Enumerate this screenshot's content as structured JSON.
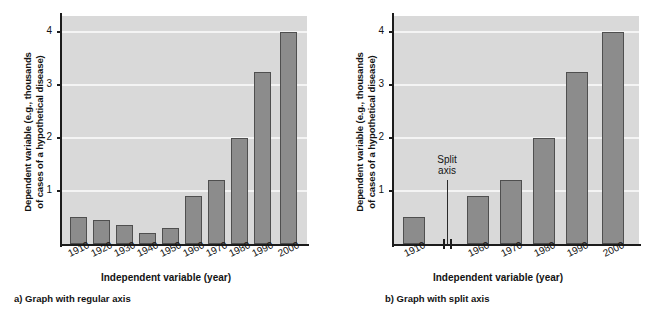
{
  "figure": {
    "axis_label_y": "Dependent variable (e.g., thousands",
    "axis_label_y_line2": "of cases of a hypothetical disease)",
    "axis_label_x": "Independent variable (year)"
  },
  "panel_a": {
    "caption": "a) Graph with regular axis"
  },
  "panel_b": {
    "caption": "b) Graph with split axis",
    "split_note_line1": "Split",
    "split_note_line2": "axis"
  },
  "colors": {
    "plot_background": "#d9d9d9",
    "gridline": "#f4f4f4",
    "bar_fill": "#8c8c8c",
    "bar_stroke": "#4f4f4f",
    "axis": "#1c1c1c",
    "text": "#131313",
    "page_background": "#ffffff"
  },
  "chart_data": [
    {
      "type": "bar",
      "title": "a) Graph with regular axis",
      "xlabel": "Independent variable (year)",
      "ylabel": "Dependent variable (e.g., thousands of cases of a hypothetical disease)",
      "categories": [
        "1910",
        "1920",
        "1930",
        "1940",
        "1950",
        "1960",
        "1970",
        "1980",
        "1990",
        "2000"
      ],
      "values": [
        0.5,
        0.45,
        0.35,
        0.2,
        0.3,
        0.9,
        1.2,
        2.0,
        3.25,
        4.0
      ],
      "ylim": [
        0,
        4.3
      ],
      "yticks": [
        1,
        2,
        3,
        4
      ],
      "ytick_labels": [
        "1",
        "2",
        "3",
        "4"
      ],
      "grid": true,
      "legend": "none",
      "split_axis": false
    },
    {
      "type": "bar",
      "title": "b) Graph with split axis",
      "xlabel": "Independent variable (year)",
      "ylabel": "Dependent variable (e.g., thousands of cases of a hypothetical disease)",
      "categories": [
        "1910",
        "1960",
        "1970",
        "1980",
        "1990",
        "2000"
      ],
      "values": [
        0.5,
        0.9,
        1.2,
        2.0,
        3.25,
        4.0
      ],
      "ylim": [
        0,
        4.3
      ],
      "yticks": [
        1,
        2,
        3,
        4
      ],
      "ytick_labels": [
        "1",
        "2",
        "3",
        "4"
      ],
      "grid": true,
      "legend": "none",
      "split_axis": true,
      "split_axis_annotation": "Split axis",
      "split_between": [
        "1910",
        "1960"
      ]
    }
  ]
}
